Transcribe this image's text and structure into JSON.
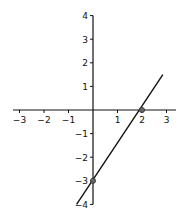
{
  "chart_data": {
    "type": "line",
    "title": "",
    "xlabel": "",
    "ylabel": "",
    "xlim": [
      -3.2,
      3.1
    ],
    "ylim": [
      -4,
      4
    ],
    "grid": false,
    "legend": null,
    "x_ticks": [
      -3,
      -2,
      -1,
      1,
      2,
      3
    ],
    "y_ticks": [
      4,
      3,
      2,
      1,
      -1,
      -2,
      -3,
      -4
    ],
    "x_tick_labels": [
      "−3",
      "−2",
      "−1",
      "1",
      "2",
      "3"
    ],
    "y_tick_labels": [
      "4",
      "3",
      "2",
      "1",
      "−1",
      "−2",
      "−3",
      "−4"
    ],
    "series": [
      {
        "name": "y = 1.5x − 3",
        "x": [
          -0.67,
          2.85
        ],
        "y": [
          -4,
          1.5
        ],
        "color": "#111111"
      }
    ],
    "points": [
      {
        "x": 0,
        "y": -3,
        "label": "y-intercept"
      },
      {
        "x": 2,
        "y": 0,
        "label": "x-intercept"
      }
    ]
  }
}
